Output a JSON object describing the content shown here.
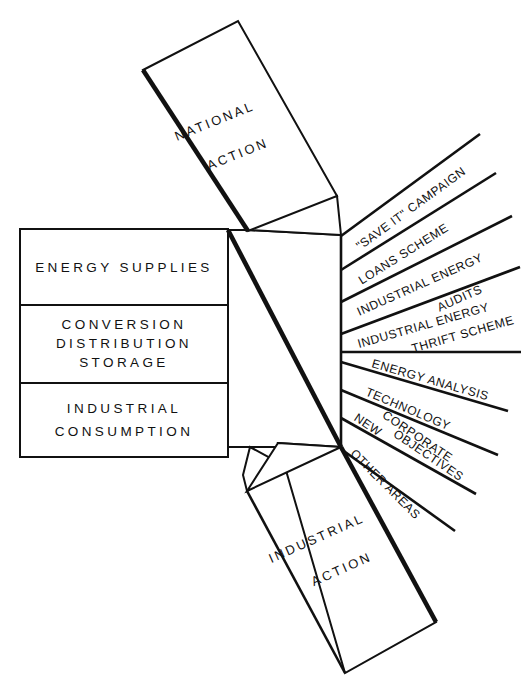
{
  "diagram": {
    "colors": {
      "ink": "#111111",
      "paper": "#ffffff"
    },
    "left_panel": {
      "name": "energy-system-stack",
      "rows": [
        {
          "id": "energy-supplies",
          "lines": [
            "ENERGY SUPPLIES"
          ]
        },
        {
          "id": "conversion-distribution-storage",
          "lines": [
            "CONVERSION",
            "DISTRIBUTION",
            "STORAGE"
          ]
        },
        {
          "id": "industrial-consumption",
          "lines": [
            "INDUSTRIAL",
            "CONSUMPTION"
          ]
        }
      ]
    },
    "top_block": {
      "name": "national-action-block",
      "lines": [
        "NATIONAL",
        "ACTION"
      ]
    },
    "bottom_block": {
      "name": "industrial-action-block",
      "lines": [
        "INDUSTRIAL",
        "ACTION"
      ]
    },
    "fan_items": [
      {
        "id": "save-it-campaign",
        "lines": [
          "\"SAVE IT\" CAMPAIGN"
        ]
      },
      {
        "id": "loans-scheme",
        "lines": [
          "LOANS SCHEME"
        ]
      },
      {
        "id": "industrial-energy-audits",
        "lines": [
          "INDUSTRIAL ENERGY",
          "AUDITS"
        ]
      },
      {
        "id": "industrial-energy-thrift-scheme",
        "lines": [
          "INDUSTRIAL ENERGY",
          "THRIFT SCHEME"
        ]
      },
      {
        "id": "energy-analysis",
        "lines": [
          "ENERGY ANALYSIS"
        ]
      },
      {
        "id": "technology",
        "lines": [
          "TECHNOLOGY"
        ]
      },
      {
        "id": "new-corporate-objectives",
        "lines": [
          "NEW",
          "CORPORATE",
          "OBJECTIVES"
        ]
      },
      {
        "id": "other-areas",
        "lines": [
          "OTHER AREAS"
        ]
      }
    ]
  }
}
